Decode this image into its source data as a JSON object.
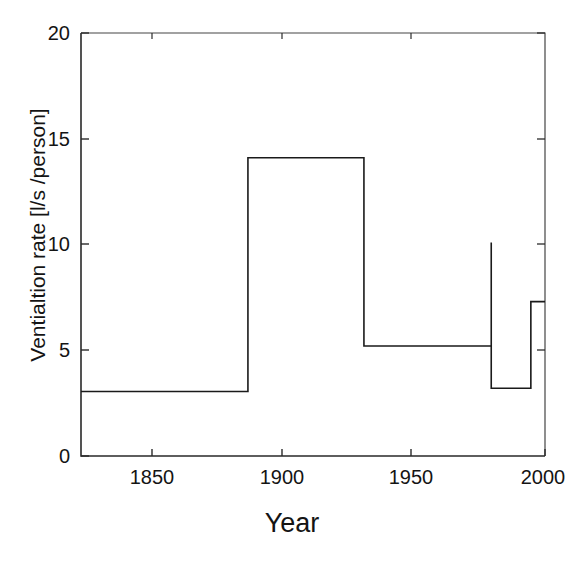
{
  "chart_data": {
    "type": "line",
    "title": "",
    "subtitle": "",
    "xlabel": "Year",
    "ylabel": "Ventialtion rate [l/s /person]",
    "xlim": [
      1836,
      2000
    ],
    "ylim": [
      0,
      20
    ],
    "grid": false,
    "legend": null,
    "line_color": "#1a1a1a",
    "style": "step-post",
    "xticks": [
      1850,
      1900,
      1950,
      2000
    ],
    "xtick_labels": [
      "1850",
      "1900",
      "1950",
      "2000"
    ],
    "yticks": [
      0,
      5,
      10,
      15,
      20
    ],
    "ytick_labels": [
      "0",
      "5",
      "10",
      "15",
      "20"
    ],
    "x": [
      1836,
      1895,
      1895,
      1936,
      1936,
      1981,
      1981,
      1981,
      1995,
      1995,
      2000
    ],
    "y": [
      3.05,
      3.05,
      14.1,
      14.1,
      5.2,
      5.2,
      10.1,
      3.2,
      3.2,
      7.3,
      7.3
    ],
    "segments": [
      {
        "start_year": 1836,
        "end_year": 1895,
        "value": 3.05
      },
      {
        "start_year": 1895,
        "end_year": 1936,
        "value": 14.1
      },
      {
        "start_year": 1936,
        "end_year": 1981,
        "value": 5.2
      },
      {
        "start_year": 1981,
        "end_year": 1981,
        "value": 10.1
      },
      {
        "start_year": 1981,
        "end_year": 1995,
        "value": 3.2
      },
      {
        "start_year": 1995,
        "end_year": 2000,
        "value": 7.3
      }
    ]
  },
  "axes": {
    "x_axis_title": "Year",
    "y_axis_title": "Ventialtion rate [l/s /person]",
    "xtick_labels": [
      "1850",
      "1900",
      "1950",
      "2000"
    ],
    "ytick_labels": [
      "0",
      "5",
      "10",
      "15",
      "20"
    ]
  }
}
